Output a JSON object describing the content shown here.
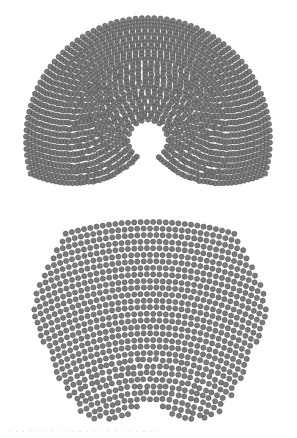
{
  "figure": {
    "dot_color": "#6e6e6e",
    "dot_stroke": "#4a4a4a",
    "background": "#ffffff"
  },
  "diagrams": [
    {
      "name": "top-hemicycle",
      "shape": "arc-keyhole",
      "center": [
        148,
        140
      ],
      "inner_radius": 20,
      "outer_radius": 122,
      "rows": 30,
      "angle_start_deg": -196,
      "angle_end_deg": 16,
      "dot_radius": 2.6,
      "dot_spacing": 6.2,
      "keyhole": {
        "hole_radius": 17,
        "slot_half_width": 6,
        "slot_bottom": 205
      }
    },
    {
      "name": "bottom-fan",
      "shape": "inverted-fan",
      "center": [
        150,
        530
      ],
      "inner_radius": 118,
      "outer_radius": 308,
      "rows": 30,
      "dot_radius": 2.6,
      "dot_spacing": 6.3,
      "clip": {
        "left": 33,
        "right": 268,
        "top": 218,
        "bottom": 420
      },
      "notch": {
        "center": [
          150,
          432
        ],
        "radius": 28
      }
    }
  ],
  "caption": {
    "text": "· · ·  ·   · · · ·  · · · · ·  · · · ·  · · · · ·"
  }
}
